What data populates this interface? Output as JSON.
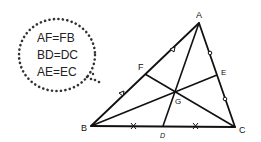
{
  "bubble": {
    "lines": [
      "AF=FB",
      "BD=DC",
      "AE=EC"
    ]
  },
  "points": {
    "A": {
      "label": "A",
      "x": 199,
      "y": 23
    },
    "B": {
      "label": "B",
      "x": 91,
      "y": 126
    },
    "C": {
      "label": "C",
      "x": 235,
      "y": 127
    },
    "D": {
      "label": "D",
      "x": 163,
      "y": 126
    },
    "E": {
      "label": "E",
      "x": 217,
      "y": 75
    },
    "F": {
      "label": "F",
      "x": 145,
      "y": 74
    },
    "G": {
      "label": "G",
      "x": 175,
      "y": 92
    }
  },
  "colors": {
    "stroke": "#111111",
    "bubble_dots": "#333333"
  }
}
